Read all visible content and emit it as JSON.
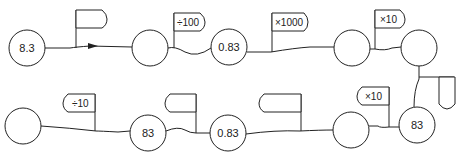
{
  "diagram": {
    "colors": {
      "stroke": "#222222",
      "background": "#ffffff"
    },
    "nodes": [
      {
        "id": "n1",
        "value": "8.3",
        "cx": 27,
        "cy": 48
      },
      {
        "id": "n2",
        "value": "",
        "cx": 150,
        "cy": 48
      },
      {
        "id": "n3",
        "value": "0.83",
        "cx": 229,
        "cy": 47
      },
      {
        "id": "n4",
        "value": "",
        "cx": 352,
        "cy": 48
      },
      {
        "id": "n5",
        "value": "",
        "cx": 419,
        "cy": 48
      },
      {
        "id": "n6",
        "value": "83",
        "cx": 417,
        "cy": 125
      },
      {
        "id": "n7",
        "value": "",
        "cx": 351,
        "cy": 130
      },
      {
        "id": "n8",
        "value": "0.83",
        "cx": 228,
        "cy": 133
      },
      {
        "id": "n9",
        "value": "83",
        "cx": 148,
        "cy": 133
      },
      {
        "id": "n10",
        "value": "",
        "cx": 23,
        "cy": 126
      }
    ],
    "operators": [
      {
        "id": "op1",
        "label": ""
      },
      {
        "id": "op2",
        "label": "÷100"
      },
      {
        "id": "op3",
        "label": "×1000"
      },
      {
        "id": "op4",
        "label": "×10"
      },
      {
        "id": "op5",
        "label": ""
      },
      {
        "id": "op6",
        "label": "×10"
      },
      {
        "id": "op7",
        "label": ""
      },
      {
        "id": "op8",
        "label": ""
      },
      {
        "id": "op9",
        "label": "÷10"
      }
    ]
  }
}
